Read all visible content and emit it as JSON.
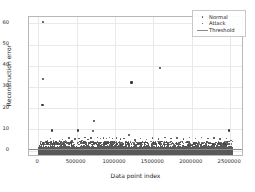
{
  "chart_data": {
    "type": "scatter",
    "title": "",
    "xlabel": "Data point index",
    "ylabel": "Reconstruction error",
    "xlim": [
      -120000,
      2680000
    ],
    "ylim": [
      -3,
      63
    ],
    "grid": true,
    "legend_position": "upper right",
    "xticks": [
      0,
      500000,
      1000000,
      1500000,
      2000000,
      2500000
    ],
    "xticklabels": [
      "0",
      "500000",
      "1000000",
      "1500000",
      "2000000",
      "2500000"
    ],
    "yticks": [
      0,
      10,
      20,
      30,
      40,
      50,
      60
    ],
    "yticklabels": [
      "0",
      "10",
      "20",
      "30",
      "40",
      "50",
      "60"
    ],
    "threshold": 1.0,
    "series": [
      {
        "name": "Normal",
        "marker": "dot",
        "color": "#4a4a4a",
        "note": "dense band of points from 0 to ~3 spanning the full index range"
      },
      {
        "name": "Attack",
        "marker": "dot",
        "color": "#4a4a4a",
        "outliers": [
          {
            "x": 52000,
            "y": 61.0
          },
          {
            "x": 48000,
            "y": 34.2
          },
          {
            "x": 42000,
            "y": 22.0
          },
          {
            "x": 1200000,
            "y": 32.6
          },
          {
            "x": 1570000,
            "y": 39.6
          },
          {
            "x": 710000,
            "y": 14.3
          },
          {
            "x": 160000,
            "y": 10.0
          },
          {
            "x": 500000,
            "y": 10.0
          },
          {
            "x": 700000,
            "y": 9.9
          },
          {
            "x": 2470000,
            "y": 10.0
          },
          {
            "x": 1170000,
            "y": 7.9
          }
        ]
      },
      {
        "name": "Threshold",
        "marker": "line",
        "color": "#8a8a8a",
        "value": 1.0
      }
    ],
    "mid_scatter": [
      {
        "x": 30000,
        "y": 4.6
      },
      {
        "x": 70000,
        "y": 4.2
      },
      {
        "x": 110000,
        "y": 5.2
      },
      {
        "x": 150000,
        "y": 6.1
      },
      {
        "x": 190000,
        "y": 5.0
      },
      {
        "x": 230000,
        "y": 4.4
      },
      {
        "x": 270000,
        "y": 4.8
      },
      {
        "x": 310000,
        "y": 5.5
      },
      {
        "x": 350000,
        "y": 5.1
      },
      {
        "x": 390000,
        "y": 6.3
      },
      {
        "x": 430000,
        "y": 4.9
      },
      {
        "x": 470000,
        "y": 5.8
      },
      {
        "x": 520000,
        "y": 6.0
      },
      {
        "x": 560000,
        "y": 5.2
      },
      {
        "x": 600000,
        "y": 6.4
      },
      {
        "x": 640000,
        "y": 5.6
      },
      {
        "x": 680000,
        "y": 6.2
      },
      {
        "x": 760000,
        "y": 6.5
      },
      {
        "x": 800000,
        "y": 6.0
      },
      {
        "x": 840000,
        "y": 6.3
      },
      {
        "x": 880000,
        "y": 6.1
      },
      {
        "x": 920000,
        "y": 6.4
      },
      {
        "x": 960000,
        "y": 6.0
      },
      {
        "x": 1010000,
        "y": 6.2
      },
      {
        "x": 1060000,
        "y": 5.8
      },
      {
        "x": 1110000,
        "y": 6.1
      },
      {
        "x": 1250000,
        "y": 5.4
      },
      {
        "x": 1320000,
        "y": 6.0
      },
      {
        "x": 1400000,
        "y": 5.7
      },
      {
        "x": 1480000,
        "y": 6.3
      },
      {
        "x": 1560000,
        "y": 5.9
      },
      {
        "x": 1640000,
        "y": 6.5
      },
      {
        "x": 1720000,
        "y": 6.0
      },
      {
        "x": 1800000,
        "y": 6.2
      },
      {
        "x": 1880000,
        "y": 5.8
      },
      {
        "x": 1960000,
        "y": 6.4
      },
      {
        "x": 2040000,
        "y": 6.1
      },
      {
        "x": 2120000,
        "y": 6.6
      },
      {
        "x": 2200000,
        "y": 6.0
      },
      {
        "x": 2280000,
        "y": 6.3
      },
      {
        "x": 2360000,
        "y": 5.9
      },
      {
        "x": 2440000,
        "y": 6.1
      },
      {
        "x": 2500000,
        "y": 5.2
      }
    ]
  },
  "legend": {
    "items": [
      {
        "label": "Normal"
      },
      {
        "label": "Attack"
      },
      {
        "label": "Threshold"
      }
    ]
  }
}
